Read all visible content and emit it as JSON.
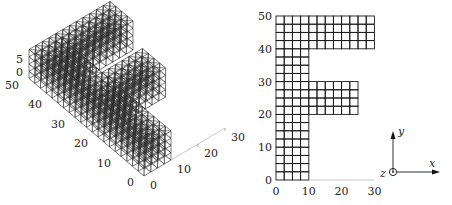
{
  "figure": {
    "left_panel": {
      "type": "3d-lattice",
      "description": "3D voxel lattice (cubic cells with diagonal struts) shaped like letter F, extruded in z",
      "z_ticks": [
        "5",
        "0"
      ],
      "y_ticks": [
        "50",
        "40",
        "30",
        "20",
        "10",
        "0"
      ],
      "x_ticks": [
        "0",
        "10",
        "20",
        "30"
      ],
      "shape_blocks": [
        {
          "x": [
            0,
            10
          ],
          "y": [
            0,
            50
          ],
          "z": [
            0,
            10
          ]
        },
        {
          "x": [
            10,
            30
          ],
          "y": [
            40,
            50
          ],
          "z": [
            0,
            10
          ]
        },
        {
          "x": [
            10,
            25
          ],
          "y": [
            20,
            30
          ],
          "z": [
            0,
            10
          ]
        }
      ],
      "cell_size": 2.5
    },
    "right_panel": {
      "type": "2d-grid",
      "description": "Top view of F-shaped grid",
      "x_ticks": [
        "0",
        "10",
        "20",
        "30"
      ],
      "y_ticks": [
        "0",
        "10",
        "20",
        "30",
        "40",
        "50"
      ],
      "shape_blocks": [
        {
          "x": [
            0,
            10
          ],
          "y": [
            0,
            50
          ]
        },
        {
          "x": [
            10,
            30
          ],
          "y": [
            40,
            50
          ]
        },
        {
          "x": [
            10,
            25
          ],
          "y": [
            20,
            30
          ]
        }
      ],
      "cell_size": 2.5
    },
    "axes_indicator": {
      "x_label": "x",
      "y_label": "y",
      "z_label": "z"
    }
  }
}
